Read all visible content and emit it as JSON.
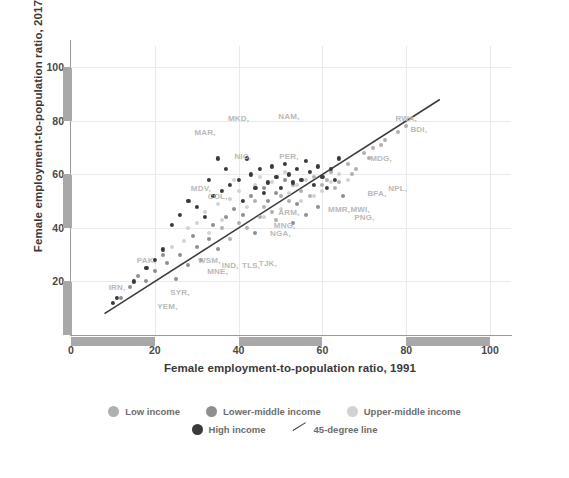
{
  "chart_data": {
    "type": "scatter",
    "title": "",
    "xlabel": "Female employment-to-population ratio, 1991",
    "ylabel": "Female employment-to-population ratio, 2017",
    "xlim": [
      0,
      105
    ],
    "ylim": [
      0,
      108
    ],
    "xticks": [
      0,
      20,
      40,
      60,
      80,
      100
    ],
    "yticks": [
      20,
      40,
      60,
      80,
      100
    ],
    "grid": true,
    "legend_position": "bottom",
    "reference_line": {
      "label": "45-degree line",
      "slope": 1,
      "intercept": 0,
      "x_start": 8,
      "x_end": 88,
      "color": "#3c3c3c"
    },
    "series": [
      {
        "name": "Low income",
        "color": "#b0b0b0",
        "points": [
          {
            "x": 58,
            "y": 59
          },
          {
            "x": 62,
            "y": 61
          },
          {
            "x": 66,
            "y": 64
          },
          {
            "x": 70,
            "y": 68
          },
          {
            "x": 72,
            "y": 70
          },
          {
            "x": 75,
            "y": 73
          },
          {
            "x": 78,
            "y": 76
          },
          {
            "x": 80,
            "y": 78
          },
          {
            "x": 64,
            "y": 57
          },
          {
            "x": 68,
            "y": 62
          },
          {
            "x": 55,
            "y": 54
          },
          {
            "x": 60,
            "y": 56
          },
          {
            "x": 52,
            "y": 50
          },
          {
            "x": 48,
            "y": 46
          },
          {
            "x": 45,
            "y": 44
          },
          {
            "x": 42,
            "y": 40
          },
          {
            "x": 57,
            "y": 52
          },
          {
            "x": 63,
            "y": 55
          },
          {
            "x": 71,
            "y": 66
          },
          {
            "x": 74,
            "y": 71
          },
          {
            "x": 50,
            "y": 52
          },
          {
            "x": 46,
            "y": 48
          },
          {
            "x": 38,
            "y": 36
          },
          {
            "x": 36,
            "y": 40
          },
          {
            "x": 53,
            "y": 56
          },
          {
            "x": 61,
            "y": 58
          },
          {
            "x": 67,
            "y": 60
          },
          {
            "x": 40,
            "y": 42
          },
          {
            "x": 44,
            "y": 50
          },
          {
            "x": 49,
            "y": 43
          }
        ]
      },
      {
        "name": "Lower-middle income",
        "color": "#8f8f8f",
        "points": [
          {
            "x": 14,
            "y": 18
          },
          {
            "x": 16,
            "y": 22
          },
          {
            "x": 20,
            "y": 24
          },
          {
            "x": 23,
            "y": 27
          },
          {
            "x": 26,
            "y": 30
          },
          {
            "x": 28,
            "y": 26
          },
          {
            "x": 30,
            "y": 33
          },
          {
            "x": 33,
            "y": 36
          },
          {
            "x": 35,
            "y": 32
          },
          {
            "x": 37,
            "y": 44
          },
          {
            "x": 39,
            "y": 47
          },
          {
            "x": 41,
            "y": 45
          },
          {
            "x": 43,
            "y": 52
          },
          {
            "x": 46,
            "y": 55
          },
          {
            "x": 47,
            "y": 50
          },
          {
            "x": 49,
            "y": 53
          },
          {
            "x": 51,
            "y": 58
          },
          {
            "x": 54,
            "y": 49
          },
          {
            "x": 56,
            "y": 45
          },
          {
            "x": 59,
            "y": 48
          },
          {
            "x": 25,
            "y": 21
          },
          {
            "x": 31,
            "y": 28
          },
          {
            "x": 34,
            "y": 41
          },
          {
            "x": 44,
            "y": 38
          },
          {
            "x": 12,
            "y": 14
          },
          {
            "x": 18,
            "y": 20
          },
          {
            "x": 53,
            "y": 42
          },
          {
            "x": 65,
            "y": 52
          },
          {
            "x": 29,
            "y": 37
          },
          {
            "x": 22,
            "y": 30
          }
        ]
      },
      {
        "name": "Upper-middle income",
        "color": "#d2d2d2",
        "points": [
          {
            "x": 32,
            "y": 46
          },
          {
            "x": 35,
            "y": 49
          },
          {
            "x": 38,
            "y": 51
          },
          {
            "x": 40,
            "y": 54
          },
          {
            "x": 42,
            "y": 48
          },
          {
            "x": 44,
            "y": 56
          },
          {
            "x": 46,
            "y": 44
          },
          {
            "x": 48,
            "y": 57
          },
          {
            "x": 50,
            "y": 47
          },
          {
            "x": 52,
            "y": 53
          },
          {
            "x": 54,
            "y": 56
          },
          {
            "x": 56,
            "y": 58
          },
          {
            "x": 58,
            "y": 52
          },
          {
            "x": 60,
            "y": 54
          },
          {
            "x": 30,
            "y": 42
          },
          {
            "x": 28,
            "y": 40
          },
          {
            "x": 33,
            "y": 38
          },
          {
            "x": 36,
            "y": 43
          },
          {
            "x": 62,
            "y": 57
          },
          {
            "x": 64,
            "y": 60
          },
          {
            "x": 66,
            "y": 58
          },
          {
            "x": 27,
            "y": 35
          },
          {
            "x": 24,
            "y": 33
          },
          {
            "x": 45,
            "y": 59
          },
          {
            "x": 51,
            "y": 61
          },
          {
            "x": 55,
            "y": 50
          },
          {
            "x": 39,
            "y": 58
          }
        ]
      },
      {
        "name": "High income",
        "color": "#3a3a3a",
        "points": [
          {
            "x": 34,
            "y": 52
          },
          {
            "x": 36,
            "y": 54
          },
          {
            "x": 38,
            "y": 56
          },
          {
            "x": 40,
            "y": 58
          },
          {
            "x": 41,
            "y": 50
          },
          {
            "x": 43,
            "y": 60
          },
          {
            "x": 44,
            "y": 55
          },
          {
            "x": 45,
            "y": 62
          },
          {
            "x": 46,
            "y": 53
          },
          {
            "x": 47,
            "y": 57
          },
          {
            "x": 48,
            "y": 63
          },
          {
            "x": 49,
            "y": 59
          },
          {
            "x": 50,
            "y": 55
          },
          {
            "x": 51,
            "y": 64
          },
          {
            "x": 52,
            "y": 60
          },
          {
            "x": 53,
            "y": 57
          },
          {
            "x": 54,
            "y": 62
          },
          {
            "x": 55,
            "y": 58
          },
          {
            "x": 56,
            "y": 65
          },
          {
            "x": 57,
            "y": 61
          },
          {
            "x": 58,
            "y": 56
          },
          {
            "x": 59,
            "y": 63
          },
          {
            "x": 60,
            "y": 59
          },
          {
            "x": 62,
            "y": 62
          },
          {
            "x": 64,
            "y": 66
          },
          {
            "x": 30,
            "y": 48
          },
          {
            "x": 32,
            "y": 44
          },
          {
            "x": 28,
            "y": 50
          },
          {
            "x": 26,
            "y": 45
          },
          {
            "x": 24,
            "y": 41
          },
          {
            "x": 20,
            "y": 28
          },
          {
            "x": 22,
            "y": 32
          },
          {
            "x": 18,
            "y": 25
          },
          {
            "x": 15,
            "y": 20
          },
          {
            "x": 11,
            "y": 14
          },
          {
            "x": 10,
            "y": 12
          },
          {
            "x": 42,
            "y": 66
          },
          {
            "x": 37,
            "y": 62
          },
          {
            "x": 61,
            "y": 55
          },
          {
            "x": 63,
            "y": 58
          },
          {
            "x": 35,
            "y": 66
          },
          {
            "x": 33,
            "y": 58
          }
        ]
      }
    ],
    "point_labels": [
      {
        "code": "MKD",
        "x": 40,
        "y": 81
      },
      {
        "code": "NAM",
        "x": 52,
        "y": 82
      },
      {
        "code": "MAR",
        "x": 32,
        "y": 76
      },
      {
        "code": "NIC",
        "x": 41,
        "y": 67
      },
      {
        "code": "PER",
        "x": 52,
        "y": 67
      },
      {
        "code": "MDV",
        "x": 31,
        "y": 55
      },
      {
        "code": "COL",
        "x": 35,
        "y": 52
      },
      {
        "code": "RWA",
        "x": 80,
        "y": 81
      },
      {
        "code": "BDI",
        "x": 83,
        "y": 77
      },
      {
        "code": "MDG",
        "x": 74,
        "y": 66
      },
      {
        "code": "BFA",
        "x": 73,
        "y": 53
      },
      {
        "code": "NPL",
        "x": 78,
        "y": 55
      },
      {
        "code": "MWI",
        "x": 69,
        "y": 47
      },
      {
        "code": "PNG",
        "x": 70,
        "y": 44
      },
      {
        "code": "MMR",
        "x": 64,
        "y": 47
      },
      {
        "code": "ARM",
        "x": 52,
        "y": 46
      },
      {
        "code": "MNG",
        "x": 51,
        "y": 41
      },
      {
        "code": "NGA",
        "x": 50,
        "y": 38
      },
      {
        "code": "IND",
        "x": 38,
        "y": 26
      },
      {
        "code": "TLS",
        "x": 43,
        "y": 26
      },
      {
        "code": "TJK",
        "x": 47,
        "y": 27
      },
      {
        "code": "WSM",
        "x": 33,
        "y": 28
      },
      {
        "code": "MNE",
        "x": 35,
        "y": 24
      },
      {
        "code": "PAK",
        "x": 18,
        "y": 28
      },
      {
        "code": "IRN",
        "x": 11,
        "y": 18
      },
      {
        "code": "SYR",
        "x": 26,
        "y": 16
      },
      {
        "code": "YEM",
        "x": 23,
        "y": 11
      }
    ],
    "legend": [
      {
        "label": "Low income",
        "color": "#b0b0b0",
        "marker": "circle"
      },
      {
        "label": "Lower-middle income",
        "color": "#8f8f8f",
        "marker": "circle"
      },
      {
        "label": "Upper-middle income",
        "color": "#d2d2d2",
        "marker": "circle"
      },
      {
        "label": "High income",
        "color": "#3a3a3a",
        "marker": "circle"
      },
      {
        "label": "45-degree line",
        "color": "#3c3c3c",
        "marker": "line"
      }
    ],
    "axis_range_bands": {
      "color": "#a8a8a8",
      "y_segments": [
        [
          80,
          100
        ],
        [
          40,
          60
        ],
        [
          0,
          20
        ]
      ],
      "x_segments": [
        [
          0,
          20
        ],
        [
          40,
          60
        ],
        [
          80,
          100
        ]
      ]
    }
  }
}
